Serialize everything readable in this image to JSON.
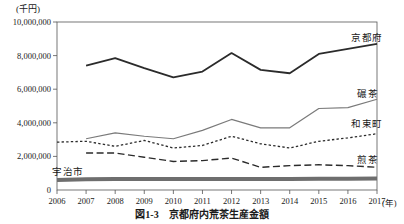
{
  "figure": {
    "caption_number": "図1-3",
    "caption_title": "京都府内荒茶生産金額",
    "y_unit_label": "(千円)",
    "x_unit_label": "(年)"
  },
  "chart_data": {
    "type": "line",
    "title": "京都府内荒茶生産金額",
    "xlabel": "(年)",
    "ylabel": "(千円)",
    "grid": false,
    "legend_position": "inline-right",
    "ylim": [
      0,
      10000000
    ],
    "yticks": [
      0,
      2000000,
      4000000,
      6000000,
      8000000,
      10000000
    ],
    "ytick_labels": [
      "0",
      "2,000,000",
      "4,000,000",
      "6,000,000",
      "8,000,000",
      "10,000,000"
    ],
    "categories": [
      2006,
      2007,
      2008,
      2009,
      2010,
      2011,
      2012,
      2013,
      2014,
      2015,
      2016,
      2017
    ],
    "xtick_labels": [
      "2006",
      "2007",
      "2008",
      "2009",
      "2010",
      "2011",
      "2012",
      "2013",
      "2014",
      "2015",
      "2016",
      "2017"
    ],
    "series": [
      {
        "name": "京都府",
        "style": "solid",
        "color": "#2b2b2b",
        "width": 1.8,
        "x": [
          2007,
          2008,
          2009,
          2010,
          2011,
          2012,
          2013,
          2014,
          2015,
          2016,
          2017
        ],
        "values": [
          7400000,
          7850000,
          7250000,
          6700000,
          7050000,
          8150000,
          7150000,
          6950000,
          8100000,
          8400000,
          8700000
        ]
      },
      {
        "name": "碾茶",
        "style": "solid",
        "color": "#7a7a7a",
        "width": 1.2,
        "x": [
          2007,
          2008,
          2009,
          2010,
          2011,
          2012,
          2013,
          2014,
          2015,
          2016,
          2017
        ],
        "values": [
          3050000,
          3400000,
          3200000,
          3050000,
          3550000,
          4200000,
          3700000,
          3700000,
          4850000,
          4900000,
          5400000
        ]
      },
      {
        "name": "和束町",
        "style": "dotted",
        "color": "#2b2b2b",
        "width": 1.3,
        "x": [
          2006,
          2007,
          2008,
          2009,
          2010,
          2011,
          2012,
          2013,
          2014,
          2015,
          2016,
          2017
        ],
        "values": [
          2850000,
          2900000,
          2600000,
          2950000,
          2500000,
          2650000,
          3200000,
          2750000,
          2500000,
          2900000,
          3100000,
          3350000
        ]
      },
      {
        "name": "煎茶",
        "style": "dashed",
        "color": "#2b2b2b",
        "width": 1.4,
        "x": [
          2007,
          2008,
          2009,
          2010,
          2011,
          2012,
          2013,
          2014,
          2015,
          2016,
          2017
        ],
        "values": [
          2200000,
          2200000,
          1950000,
          1700000,
          1750000,
          1900000,
          1350000,
          1450000,
          1500000,
          1450000,
          1350000
        ]
      },
      {
        "name": "宇治市",
        "style": "thick-solid",
        "color": "#6e6e6e",
        "width": 4.0,
        "x": [
          2006,
          2007,
          2008,
          2009,
          2010,
          2011,
          2012,
          2013,
          2014,
          2015,
          2016,
          2017
        ],
        "values": [
          600000,
          640000,
          650000,
          650000,
          650000,
          650000,
          660000,
          660000,
          660000,
          670000,
          670000,
          680000
        ]
      }
    ],
    "series_annotations": [
      {
        "name": "京都府",
        "x": 351,
        "y": 30
      },
      {
        "name": "碾茶",
        "x": 357,
        "y": 86
      },
      {
        "name": "和束町",
        "x": 351,
        "y": 116
      },
      {
        "name": "煎茶",
        "x": 357,
        "y": 152
      },
      {
        "name": "宇治市",
        "x": 52,
        "y": 164
      }
    ]
  }
}
